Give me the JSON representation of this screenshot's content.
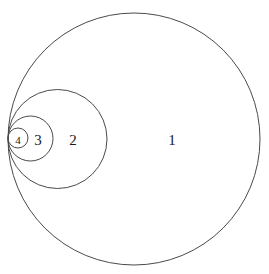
{
  "figure": {
    "canvas": {
      "width": 269,
      "height": 274
    },
    "background_color": "#ffffff",
    "stroke_color": "#4a4a4a",
    "label_color": "#1a1a1a",
    "tangent_point": {
      "x": 8,
      "y": 139
    },
    "circles": [
      {
        "label": "1",
        "name": "circle-1",
        "cx": 134,
        "cy": 139,
        "r": 126,
        "label_x": 172,
        "label_y": 140
      },
      {
        "label": "2",
        "name": "circle-2",
        "cx": 57.5,
        "cy": 139,
        "r": 49.5,
        "label_x": 73,
        "label_y": 140
      },
      {
        "label": "3",
        "name": "circle-3",
        "cx": 30.5,
        "cy": 138.5,
        "r": 22.5,
        "label_x": 38,
        "label_y": 140
      },
      {
        "label": "4",
        "name": "circle-4",
        "cx": 18,
        "cy": 138,
        "r": 10,
        "label_x": 18,
        "label_y": 140
      }
    ]
  }
}
